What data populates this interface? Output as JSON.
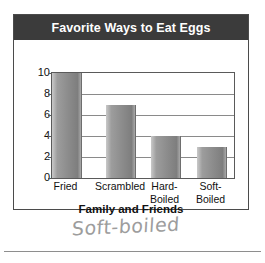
{
  "chart_data": {
    "type": "bar",
    "title": "Favorite Ways to Eat Eggs",
    "xlabel": "Family and Friends",
    "ylabel": "",
    "categories": [
      "Fried",
      "Scrambled",
      "Hard-\nBoiled",
      "Soft-\nBoiled"
    ],
    "values": [
      10,
      7,
      4,
      3
    ],
    "ylim": [
      0,
      10
    ],
    "yticks": [
      0,
      2,
      4,
      6,
      8,
      10
    ],
    "ytick_labels": [
      "0",
      "2",
      "4",
      "6",
      "8",
      "10"
    ],
    "grid": true,
    "legend": false,
    "colors": {
      "title_bar_background": "#3b3b3b",
      "title_text": "#ffffff",
      "bar_fill_light": "#c9c9c9",
      "bar_fill_dark": "#7e7e7e",
      "axis_line": "#5a5a5a",
      "gridline": "#8a8a8a",
      "card_border": "#4b4b4b",
      "page_background": "#ffffff"
    }
  },
  "annotation": {
    "handwritten_note": "Soft-boiled"
  }
}
